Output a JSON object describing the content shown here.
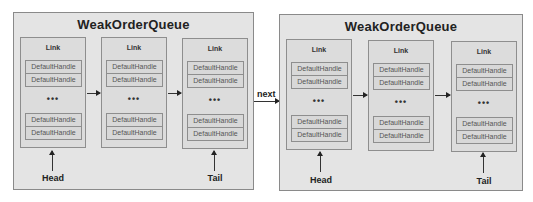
{
  "diagram": {
    "colors": {
      "queue_fill": "#e4e4e4",
      "link_fill": "#dcdcdc",
      "border": "#8e8e8e",
      "arrow": "#222222"
    },
    "connector_label": "next",
    "queues": [
      {
        "title": "WeakOrderQueue",
        "links": [
          {
            "title": "Link",
            "top_handles": [
              "DefaultHandle",
              "DefaultHandle"
            ],
            "ellipsis": "•••",
            "bottom_handles": [
              "DefaultHandle",
              "DefaultHandle"
            ]
          },
          {
            "title": "Link",
            "top_handles": [
              "DefaultHandle",
              "DefaultHandle"
            ],
            "ellipsis": "•••",
            "bottom_handles": [
              "DefaultHandle",
              "DefaultHandle"
            ]
          },
          {
            "title": "Link",
            "top_handles": [
              "DefaultHandle",
              "DefaultHandle"
            ],
            "ellipsis": "•••",
            "bottom_handles": [
              "DefaultHandle",
              "DefaultHandle"
            ]
          }
        ],
        "head_label": "Head",
        "tail_label": "Tail"
      },
      {
        "title": "WeakOrderQueue",
        "links": [
          {
            "title": "Link",
            "top_handles": [
              "DefaultHandle",
              "DefaultHandle"
            ],
            "ellipsis": "•••",
            "bottom_handles": [
              "DefaultHandle",
              "DefaultHandle"
            ]
          },
          {
            "title": "Link",
            "top_handles": [
              "DefaultHandle",
              "DefaultHandle"
            ],
            "ellipsis": "•••",
            "bottom_handles": [
              "DefaultHandle",
              "DefaultHandle"
            ]
          },
          {
            "title": "Link",
            "top_handles": [
              "DefaultHandle",
              "DefaultHandle"
            ],
            "ellipsis": "•••",
            "bottom_handles": [
              "DefaultHandle",
              "DefaultHandle"
            ]
          }
        ],
        "head_label": "Head",
        "tail_label": "Tail"
      }
    ]
  }
}
